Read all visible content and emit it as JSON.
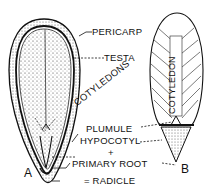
{
  "diagram": {
    "labels": {
      "pericarp": "PERICARP",
      "testa": "TESTA",
      "cotyledons": "COTYLEDONS",
      "cotyledon": "COTYLEDON",
      "plumule": "PLUMULE",
      "hypocotyl": "HYPOCOTYL",
      "plus": "+",
      "primary_root": "PRIMARY ROOT",
      "radicle": "= RADICLE"
    },
    "figure_labels": {
      "a": "A",
      "b": "B"
    },
    "colors": {
      "ink": "#111111",
      "background": "#ffffff"
    }
  }
}
